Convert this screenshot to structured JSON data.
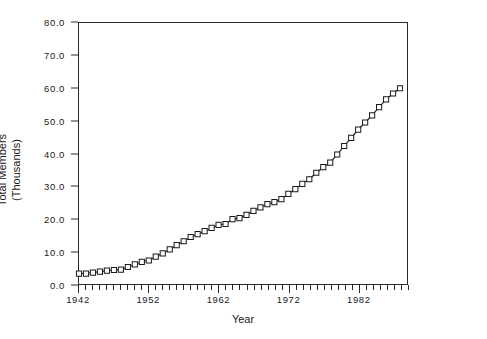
{
  "chart_data": {
    "type": "line",
    "title": "",
    "subtitle": "",
    "xlabel": "Year",
    "ylabel": "Total Members\n(Thousands)",
    "ylabel_lines": [
      "Total Members",
      "(Thousands)"
    ],
    "xlim": [
      1942,
      1989
    ],
    "ylim": [
      0.0,
      80.0
    ],
    "ytick_labels": [
      "80.0",
      "70.0",
      "60.0",
      "50.0",
      "40.0",
      "30.0",
      "20.0",
      "10.0",
      "0.0"
    ],
    "ytick_values": [
      80.0,
      70.0,
      60.0,
      50.0,
      40.0,
      30.0,
      20.0,
      10.0,
      0.0
    ],
    "xtick_labels": [
      "1942",
      "1952",
      "1962",
      "1972",
      "1982"
    ],
    "xtick_values": [
      1942,
      1952,
      1962,
      1972,
      1982
    ],
    "x_minor_tick_step": 1,
    "grid": false,
    "legend": "none",
    "marker": "square-open",
    "line_color": "#1a1a1a",
    "marker_face_color": "#ffffff",
    "marker_edge_color": "#1a1a1a",
    "series": [
      {
        "name": "Total Members",
        "x": [
          1942,
          1943,
          1944,
          1945,
          1946,
          1947,
          1948,
          1949,
          1950,
          1951,
          1952,
          1953,
          1954,
          1955,
          1956,
          1957,
          1958,
          1959,
          1960,
          1961,
          1962,
          1963,
          1964,
          1965,
          1966,
          1967,
          1968,
          1969,
          1970,
          1971,
          1972,
          1973,
          1974,
          1975,
          1976,
          1977,
          1978,
          1979,
          1980,
          1981,
          1982,
          1983,
          1984,
          1985,
          1986,
          1987,
          1988
        ],
        "values": [
          3.2,
          3.2,
          3.5,
          3.8,
          4.1,
          4.3,
          4.4,
          5.2,
          6.0,
          6.8,
          7.2,
          8.4,
          9.4,
          10.6,
          11.9,
          13.1,
          14.4,
          15.3,
          16.2,
          17.2,
          18.1,
          18.4,
          19.9,
          20.2,
          21.2,
          22.4,
          23.5,
          24.5,
          25.1,
          26.0,
          27.6,
          29.1,
          30.7,
          32.1,
          34.1,
          35.8,
          37.2,
          39.7,
          42.3,
          44.8,
          47.3,
          49.5,
          51.7,
          54.2,
          56.6,
          58.4,
          60.0
        ]
      }
    ]
  }
}
